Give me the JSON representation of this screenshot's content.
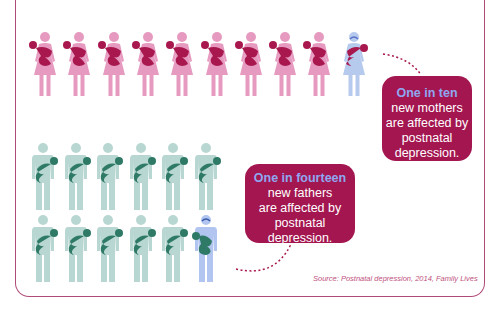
{
  "mothers": {
    "total": 10,
    "affected_index": 9,
    "colors": {
      "figure": "#e79ac0",
      "baby": "#a8184f",
      "affected_figure": "#b6caee"
    },
    "callout": {
      "headline": "One in ten",
      "lines": [
        "new mothers",
        "are affected by",
        "postnatal",
        "depression."
      ]
    }
  },
  "fathers": {
    "total": 12,
    "rows": [
      6,
      6
    ],
    "affected_index": 11,
    "colors": {
      "figure": "#b9d7d2",
      "baby": "#2e7a66",
      "affected_figure": "#b1c5f0"
    },
    "callout": {
      "headline": "One in fourteen",
      "lines": [
        "new fathers",
        "are affected by",
        "postnatal",
        "depression."
      ]
    }
  },
  "source": "Source: Postnatal depression, 2014, Family Lives",
  "colors": {
    "frame": "#b04a78",
    "callout_bg": "#a3164f",
    "headline": "#8fa7f0"
  }
}
